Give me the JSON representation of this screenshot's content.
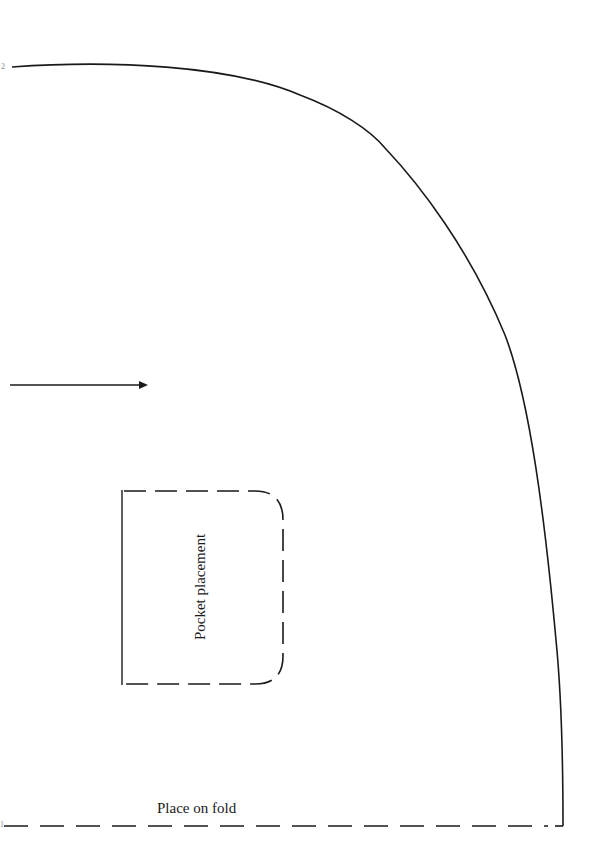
{
  "page": {
    "type": "sewing-pattern-piece",
    "background": "#ffffff",
    "line_color": "#1a1a1a"
  },
  "labels": {
    "fold": "Place on fold",
    "pocket": "Pocket placement",
    "corner_mark_top": "2",
    "corner_mark_bottom": "1"
  },
  "elements": {
    "grainline_arrow": {
      "x1": 10,
      "x2": 148,
      "y": 385
    },
    "fold_line": {
      "y": 826,
      "x1": 0,
      "x2": 562,
      "style": "dashed"
    },
    "outline_curve": {
      "start": [
        12,
        67
      ],
      "end": [
        563,
        826
      ]
    },
    "pocket": {
      "left": 122,
      "top": 491,
      "right": 283,
      "bottom": 684,
      "corner_radius": 28
    }
  }
}
